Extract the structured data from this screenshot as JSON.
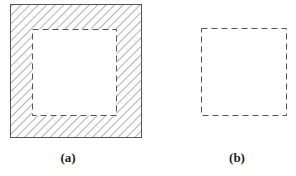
{
  "figure": {
    "panels": [
      {
        "id": "a",
        "caption": "(a)",
        "description": "Square with hatched frame surrounding a dashed inner square (hollow region)",
        "outer_square": {
          "x": 10,
          "y": 4,
          "w": 131,
          "h": 133
        },
        "inner_square": {
          "x": 32,
          "y": 29,
          "w": 84,
          "h": 86
        },
        "outer_border": "solid",
        "inner_border": "dashed",
        "fill": "diagonal-hatch"
      },
      {
        "id": "b",
        "caption": "(b)",
        "description": "Dashed square alone",
        "square": {
          "x": 201,
          "y": 28,
          "w": 85,
          "h": 87
        },
        "border": "dashed"
      }
    ],
    "colors": {
      "line": "#555555",
      "hatch": "#666666",
      "background": "#ffffff",
      "text": "#222222"
    }
  }
}
